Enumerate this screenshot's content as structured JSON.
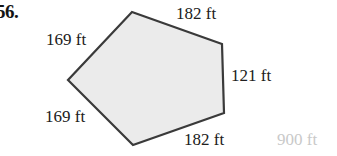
{
  "problem": {
    "number": "56."
  },
  "figure": {
    "type": "polygon",
    "name": "irregular-pentagon",
    "fill_color": "#ebebeb",
    "stroke_color": "#3a3a3a",
    "vertices": [
      {
        "name": "top",
        "x": 132,
        "y": 12
      },
      {
        "name": "right-top",
        "x": 222,
        "y": 44
      },
      {
        "name": "right-bottom",
        "x": 224,
        "y": 113
      },
      {
        "name": "bottom",
        "x": 133,
        "y": 145
      },
      {
        "name": "left",
        "x": 68,
        "y": 80
      }
    ],
    "side_labels": {
      "top": "182 ft",
      "right": "121 ft",
      "bottom": "182 ft",
      "lower_left": "169 ft",
      "upper_left": "169 ft"
    }
  },
  "artifacts": {
    "faded_label": "900 ft",
    "faded_label_color": "#c9c9c9"
  }
}
